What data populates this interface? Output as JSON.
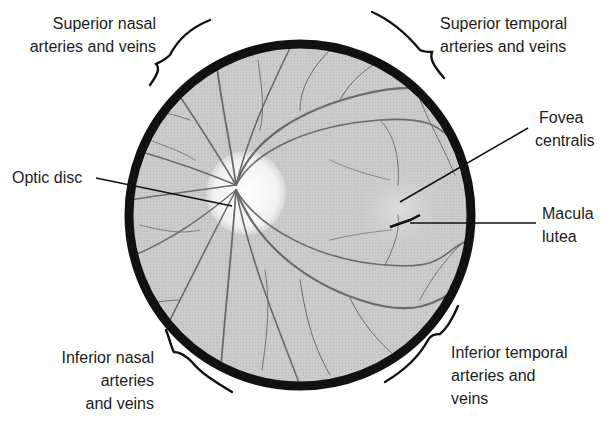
{
  "colors": {
    "rim": "#111111",
    "retina_bg": "#c9c9c9",
    "vessel": "#6a6a6a",
    "optic_disc": "#f4f4f4",
    "macula": "#d8d8d8",
    "leader_line": "#111111",
    "text": "#1c1c1c"
  },
  "labels": {
    "superior_nasal": {
      "lines": [
        "Superior nasal",
        "arteries and veins"
      ]
    },
    "superior_temporal": {
      "lines": [
        "Superior temporal",
        "arteries and veins"
      ]
    },
    "optic_disc": {
      "lines": [
        "Optic disc"
      ]
    },
    "fovea_centralis": {
      "lines": [
        "Fovea",
        "centralis"
      ]
    },
    "macula_lutea": {
      "lines": [
        "Macula",
        "lutea"
      ]
    },
    "inferior_nasal": {
      "lines": [
        "Inferior nasal",
        "arteries",
        "and veins"
      ]
    },
    "inferior_temporal": {
      "lines": [
        "Inferior temporal",
        "arteries and",
        "veins"
      ]
    }
  }
}
